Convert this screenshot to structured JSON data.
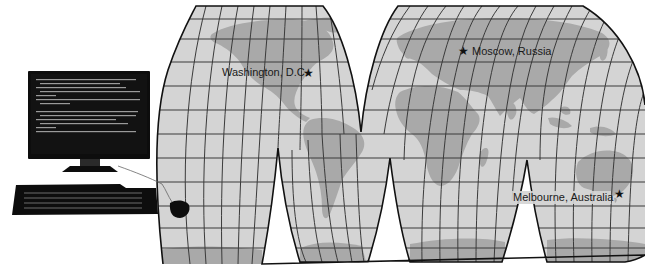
{
  "figure": {
    "colors": {
      "ocean": "#d4d4d4",
      "land": "#a9a9a9",
      "grid": "#3a3a3a",
      "outline": "#111111",
      "computer": "#0d0d0d",
      "background": "#ffffff"
    }
  },
  "computer": {
    "monitor": {
      "screen_text": "illegible terminal text"
    },
    "keyboard": {},
    "mouse": {}
  },
  "map": {
    "projection": "interrupted (Goode-style)",
    "locations": [
      {
        "name": "Washington, D.C.",
        "marker": "star",
        "label_side": "left"
      },
      {
        "name": "Moscow, Russia",
        "marker": "star",
        "label_side": "right"
      },
      {
        "name": "Melbourne, Australia",
        "marker": "star",
        "label_side": "left"
      }
    ]
  }
}
